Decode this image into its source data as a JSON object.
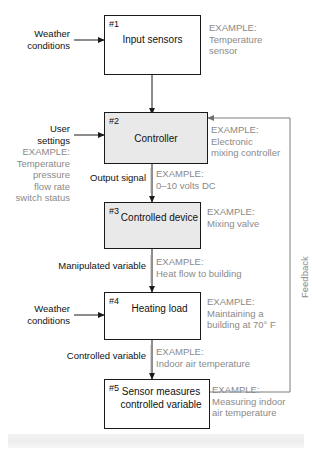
{
  "diagram": {
    "colors": {
      "box_stroke": "#1a1a1a",
      "box_shaded_fill": "#e9e9e9",
      "box_plain_fill": "#ffffff",
      "text": "#111111",
      "example_text": "#8a8a8a",
      "wire": "#1a1a1a",
      "feedback_wire": "#8a8a8a"
    },
    "blocks": [
      {
        "number": "#1",
        "label": "Input\nsensors",
        "shaded": false
      },
      {
        "number": "#2",
        "label": "Controller",
        "shaded": true
      },
      {
        "number": "#3",
        "label": "Controlled\ndevice",
        "shaded": true
      },
      {
        "number": "#4",
        "label": "Heating\nload",
        "shaded": false
      },
      {
        "number": "#5",
        "label": "Sensor\nmeasures\ncontrolled variable",
        "shaded": false
      }
    ],
    "inputs": [
      {
        "label": "Weather\nconditions",
        "target": "#1"
      },
      {
        "label": "User\nsettings",
        "target": "#2"
      },
      {
        "label": "Weather\nconditions",
        "target": "#4"
      }
    ],
    "signal_labels": [
      {
        "label": "Output signal",
        "between": "#2 to #3"
      },
      {
        "label": "Manipulated variable",
        "between": "#3 to #4"
      },
      {
        "label": "Controlled variable",
        "between": "#4 to #5"
      }
    ],
    "examples": [
      {
        "for": "#1",
        "heading": "EXAMPLE:",
        "body": "Temperature\nsensor"
      },
      {
        "for": "user settings",
        "heading": "EXAMPLE:",
        "body": "Temperature\npressure\nflow rate\nswitch status"
      },
      {
        "for": "#2",
        "heading": "EXAMPLE:",
        "body": "Electronic\nmixing controller"
      },
      {
        "for": "output signal",
        "heading": "EXAMPLE:",
        "body": "0–10 volts DC"
      },
      {
        "for": "#3",
        "heading": "EXAMPLE:",
        "body": "Mixing valve"
      },
      {
        "for": "manipulated variable",
        "heading": "EXAMPLE:",
        "body": "Heat flow to building"
      },
      {
        "for": "#4",
        "heading": "EXAMPLE:",
        "body": "Maintaining a\nbuilding at 70° F"
      },
      {
        "for": "controlled variable",
        "heading": "EXAMPLE:",
        "body": "Indoor air temperature"
      },
      {
        "for": "#5",
        "heading": "EXAMPLE:",
        "body": "Measuring indoor\nair temperature"
      }
    ],
    "feedback": {
      "label": "Feedback",
      "from": "#5",
      "to": "#2"
    }
  },
  "text": {
    "b1_num": "#1",
    "b1_label": "Input\nsensors",
    "b2_num": "#2",
    "b2_label": "Controller",
    "b3_num": "#3",
    "b3_label": "Controlled\ndevice",
    "b4_num": "#4",
    "b4_label": "Heating\nload",
    "b5_num": "#5",
    "b5_label": "Sensor\nmeasures\ncontrolled variable",
    "in_weather_1": "Weather\nconditions",
    "in_user_settings": "User\nsettings",
    "in_weather_2": "Weather\nconditions",
    "sig_output": "Output signal",
    "sig_manipulated": "Manipulated variable",
    "sig_controlled": "Controlled variable",
    "ex_b1": "EXAMPLE:\nTemperature\nsensor",
    "ex_user": "EXAMPLE:\nTemperature\npressure\nflow rate\nswitch status",
    "ex_b2": "EXAMPLE:\nElectronic\nmixing controller",
    "ex_output": "EXAMPLE:\n0–10 volts DC",
    "ex_b3": "EXAMPLE:\nMixing valve",
    "ex_manipulated": "EXAMPLE:\nHeat flow to building",
    "ex_b4": "EXAMPLE:\nMaintaining a\nbuilding at 70° F",
    "ex_controlled": "EXAMPLE:\nIndoor air temperature",
    "ex_b5": "EXAMPLE:\nMeasuring indoor\nair temperature",
    "feedback": "Feedback"
  }
}
